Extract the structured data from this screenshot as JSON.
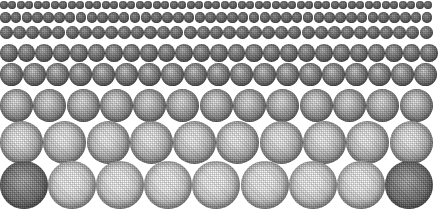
{
  "image": {
    "title": "Dithered Sphere Halftone Grid",
    "description": "Eight horizontal rows of shaded spheres rendered with a coarse dither/halftone pattern, increasing in diameter from the top row to the bottom row.",
    "width": 433,
    "height": 216,
    "background_color": "#ffffff",
    "sphere_base_color": "#6e6e6e",
    "rim_color": "#2e2e2e",
    "highlight_color": "#ffffff"
  },
  "chart_data": {
    "type": "scatter",
    "xlabel": "",
    "ylabel": "",
    "grid": false,
    "legend": null,
    "categories": [
      "row-1",
      "row-2",
      "row-3",
      "row-4",
      "row-5",
      "row-6",
      "row-7",
      "row-8"
    ],
    "series": [
      {
        "name": "sphere diameter (px)",
        "values": [
          8,
          10.5,
          13,
          17.5,
          23,
          33,
          43,
          48
        ]
      },
      {
        "name": "spheres per row",
        "values": [
          51,
          40,
          33,
          25,
          19,
          13,
          10,
          9
        ]
      },
      {
        "name": "row top y (px)",
        "values": [
          0,
          12,
          26,
          44,
          63,
          89,
          121,
          161
        ]
      }
    ]
  },
  "rows": [
    {
      "name": "row-1",
      "label": "Row 1 — smallest spheres",
      "count": 51,
      "diameter": 8,
      "gap": 0.5,
      "top": 1,
      "tone": "darkest",
      "highlight": "minimal"
    },
    {
      "name": "row-2",
      "label": "Row 2",
      "count": 40,
      "diameter": 10.5,
      "gap": 0.3,
      "top": 12,
      "tone": "very-dark",
      "highlight": "faint"
    },
    {
      "name": "row-3",
      "label": "Row 3",
      "count": 33,
      "diameter": 13,
      "gap": 0.1,
      "top": 26,
      "tone": "dark",
      "highlight": "small"
    },
    {
      "name": "row-4",
      "label": "Row 4",
      "count": 25,
      "diameter": 17.5,
      "gap": 0.0,
      "top": 44,
      "tone": "mid-dark",
      "highlight": "moderate"
    },
    {
      "name": "row-5",
      "label": "Row 5",
      "count": 19,
      "diameter": 23,
      "gap": 0.0,
      "top": 63,
      "tone": "mid",
      "highlight": "clear"
    },
    {
      "name": "row-6",
      "label": "Row 6",
      "count": 13,
      "diameter": 33,
      "gap": 0.3,
      "top": 89,
      "tone": "light",
      "highlight": "bright"
    },
    {
      "name": "row-7",
      "label": "Row 7",
      "count": 10,
      "diameter": 43,
      "gap": 0.0,
      "top": 121,
      "tone": "lighter",
      "highlight": "very-bright"
    },
    {
      "name": "row-8",
      "label": "Row 8 — largest spheres",
      "count": 9,
      "diameter": 48,
      "gap": 0.0,
      "top": 161,
      "tone": "lightest",
      "highlight": "blown-out",
      "dark_indices": [
        0,
        8
      ]
    }
  ]
}
